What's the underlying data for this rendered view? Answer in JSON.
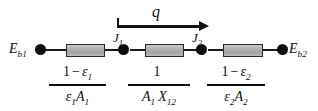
{
  "diagram": {
    "type": "thermal-resistance-network",
    "colors": {
      "line": "#111111",
      "node": "#0d0d0d",
      "resistor_fill": "#b3b3b3",
      "resistor_border": "#2b2b2b",
      "background": "#ffffff"
    },
    "terminals": {
      "left": {
        "symbol": "E",
        "subscript": "b1"
      },
      "right": {
        "symbol": "E",
        "subscript": "b2"
      }
    },
    "nodes": [
      {
        "symbol": "J",
        "subscript": "1"
      },
      {
        "symbol": "J",
        "subscript": "2"
      }
    ],
    "flow": {
      "symbol": "q",
      "direction": "left-to-right"
    },
    "resistances": [
      {
        "name": "surface-resistance-1",
        "numerator": {
          "one": "1",
          "op": "−",
          "sym": "ε",
          "sub": "1"
        },
        "denominator": {
          "sym1": "ε",
          "sub1": "1",
          "sym2": "A",
          "sub2": "1"
        }
      },
      {
        "name": "space-resistance-12",
        "numerator": {
          "one": "1",
          "op": "",
          "sym": "",
          "sub": ""
        },
        "denominator": {
          "sym1": "A",
          "sub1": "1",
          "sym2": "X",
          "sub2": "12"
        }
      },
      {
        "name": "surface-resistance-2",
        "numerator": {
          "one": "1",
          "op": "−",
          "sym": "ε",
          "sub": "2"
        },
        "denominator": {
          "sym1": "ε",
          "sub1": "2",
          "sym2": "A",
          "sub2": "2"
        }
      }
    ]
  }
}
